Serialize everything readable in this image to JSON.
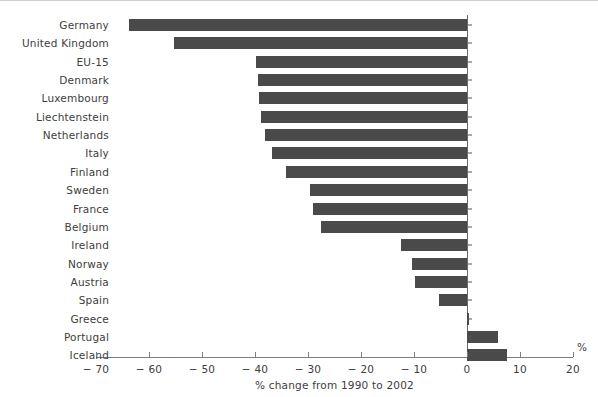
{
  "chart_data": {
    "type": "bar",
    "orientation": "horizontal",
    "title": "",
    "xlabel": "% change from 1990 to 2002",
    "ylabel": "",
    "unit_label": "%",
    "xlim": [
      -70,
      20
    ],
    "xticks": [
      -70,
      -60,
      -50,
      -40,
      -30,
      -20,
      -10,
      0,
      20
    ],
    "xtick_labels": [
      "− 70",
      "− 60",
      "− 50",
      "− 40",
      "− 30",
      "− 20",
      "− 10",
      "0",
      "10",
      "20"
    ],
    "xtick_values": [
      -70,
      -60,
      -50,
      -40,
      -30,
      -20,
      -10,
      0,
      10,
      20
    ],
    "grid": false,
    "legend": false,
    "bar_color": "#4a4a4a",
    "axis_color": "#7d7d7d",
    "text_color": "#3d3d3d",
    "categories": [
      "Germany",
      "United Kingdom",
      "EU-15",
      "Denmark",
      "Luxembourg",
      "Liechtenstein",
      "Netherlands",
      "Italy",
      "Finland",
      "Sweden",
      "France",
      "Belgium",
      "Ireland",
      "Norway",
      "Austria",
      "Spain",
      "Greece",
      "Portugal",
      "Iceland"
    ],
    "values": [
      -63.8,
      -55.3,
      -39.8,
      -39.4,
      -39.2,
      -38.9,
      -38.1,
      -36.8,
      -34.2,
      -29.6,
      -29.0,
      -27.5,
      -12.5,
      -10.4,
      -9.8,
      -5.3,
      0.4,
      5.9,
      7.6
    ]
  }
}
